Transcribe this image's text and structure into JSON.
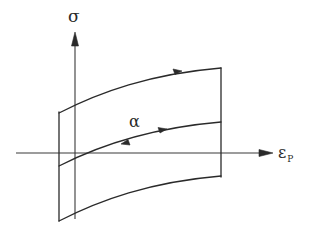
{
  "diagram": {
    "type": "yield-surface-evolution",
    "axes": {
      "vertical": {
        "label": "σ",
        "name": "stress"
      },
      "horizontal": {
        "label": "ε",
        "subscript": "P",
        "name": "plastic-strain"
      }
    },
    "curves": [
      {
        "id": "upper-bound",
        "arrows": [
          "right"
        ]
      },
      {
        "id": "back-stress",
        "label": "α",
        "arrows": [
          "left",
          "right"
        ]
      },
      {
        "id": "lower-bound",
        "arrows": []
      }
    ],
    "ink_color": "#2a2a2a",
    "background": "#ffffff"
  }
}
